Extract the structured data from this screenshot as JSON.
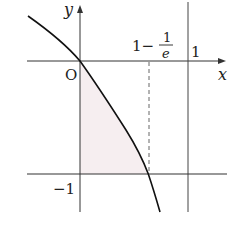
{
  "diagram": {
    "function": "y = ln(1 - x)",
    "axes": {
      "x_label": "x",
      "y_label": "y",
      "origin_label": "O"
    },
    "labels": {
      "x_one": "1",
      "y_minus_one": "−1",
      "x_mark_prefix": "1−",
      "x_mark_num": "1",
      "x_mark_den": "e"
    },
    "lines": [
      {
        "type": "vertical",
        "equation": "x = 1",
        "style": "solid"
      },
      {
        "type": "horizontal",
        "equation": "y = -1",
        "style": "solid"
      },
      {
        "type": "vertical",
        "equation": "x = 1 - 1/e",
        "style": "dashed",
        "from_y": 0,
        "to_y": -1
      }
    ],
    "shaded_region": {
      "bounds": "x = 0, y = -1, curve y = ln(1-x)",
      "fill": "#f6eef0"
    },
    "colors": {
      "ink": "#222222",
      "shade": "#f6eef0",
      "background": "#ffffff"
    }
  }
}
